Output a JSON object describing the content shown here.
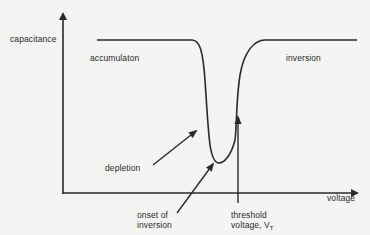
{
  "diagram": {
    "type": "C-V curve (MOS capacitor)",
    "axes": {
      "y_label": "capacitance",
      "x_label": "voltage"
    },
    "regions": {
      "accumulation": "accumulaton",
      "inversion": "inversion",
      "depletion": "depletion"
    },
    "annotations": {
      "onset_line1": "onset of",
      "onset_line2": "inversion",
      "threshold_line1": "threshold",
      "threshold_line2_prefix": "voltage, V",
      "threshold_subscript": "T"
    },
    "colors": {
      "background": "#f4f4f2",
      "stroke": "#2a2a2a",
      "text": "#2a2a2a"
    }
  }
}
